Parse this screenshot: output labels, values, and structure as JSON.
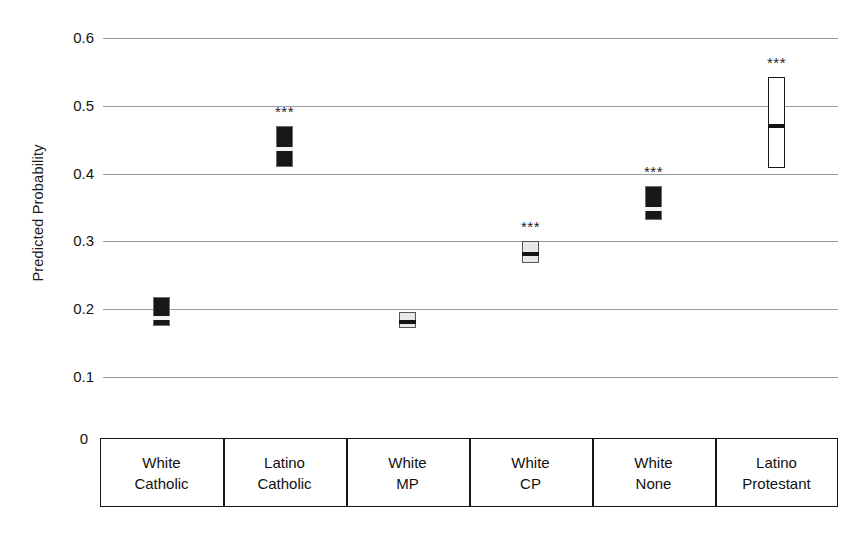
{
  "chart_data": {
    "type": "bar",
    "title": "",
    "subtitle": "",
    "xlabel": "",
    "ylabel": "Predicted Probability",
    "ylim": [
      0,
      0.6
    ],
    "grid": true,
    "legend_position": "none",
    "y_ticks": [
      "0.6",
      "0.5",
      "0.4",
      "0.3",
      "0.2",
      "0.1",
      "0"
    ],
    "y_tick_values": [
      0.6,
      0.5,
      0.4,
      0.3,
      0.2,
      0.1,
      0
    ],
    "categories": [
      "White Catholic",
      "Latino Catholic",
      "White MP",
      "White CP",
      "White None",
      "Latino Protestant"
    ],
    "category_lines": [
      [
        "White",
        "Catholic"
      ],
      [
        "Latino",
        "Catholic"
      ],
      [
        "White",
        "MP"
      ],
      [
        "White",
        "CP"
      ],
      [
        "White",
        "None"
      ],
      [
        "Latino",
        "Protestant"
      ]
    ],
    "values": [
      0.188,
      0.437,
      0.182,
      0.283,
      0.349,
      0.471
    ],
    "ci_low": [
      0.175,
      0.41,
      0.172,
      0.268,
      0.331,
      0.408
    ],
    "ci_high": [
      0.218,
      0.47,
      0.196,
      0.3,
      0.381,
      0.543
    ],
    "significance": [
      "",
      "***",
      "",
      "***",
      "***",
      "***"
    ],
    "marker_styles": [
      "dark",
      "dark",
      "light",
      "light",
      "dark",
      "white"
    ]
  },
  "colors": {
    "dark_fill": "#171717",
    "light_fill": "#e8e8e8",
    "white_fill": "#ffffff",
    "gridline": "#9a9a9a",
    "axis": "#161616",
    "text": "#141414"
  }
}
